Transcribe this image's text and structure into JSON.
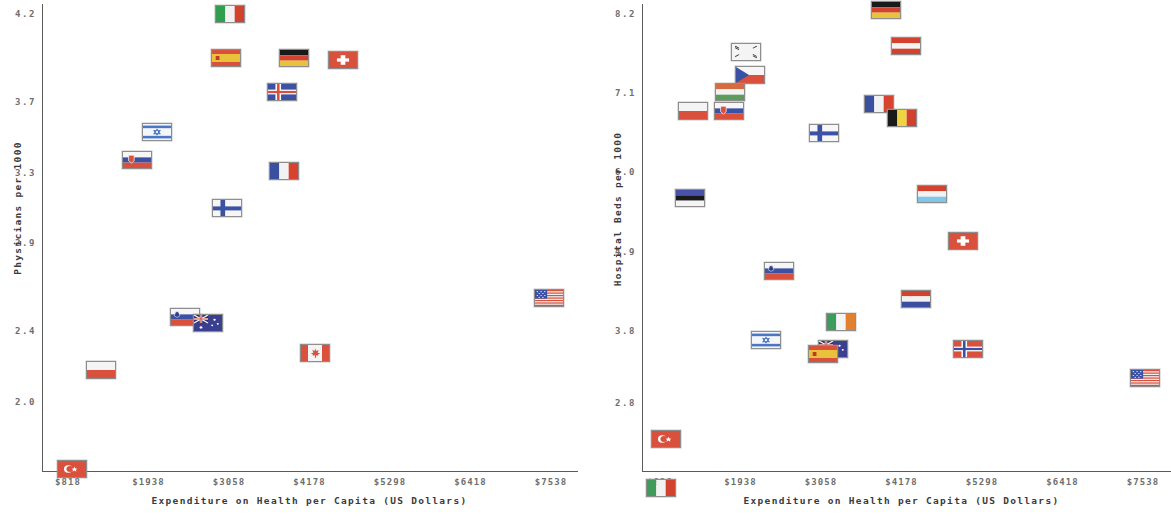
{
  "chart_data": [
    {
      "type": "scatter",
      "panel": "left",
      "title": "",
      "xlabel": "Expenditure on Health per Capita (US Dollars)",
      "ylabel": "Physicians per 1000",
      "xticks": [
        "$818",
        "$1938",
        "$3058",
        "$4178",
        "$5298",
        "$6418",
        "$7538"
      ],
      "xtickvalues": [
        818,
        1938,
        3058,
        4178,
        5298,
        6418,
        7538
      ],
      "yticks": [
        "4.2",
        "3.7",
        "3.3",
        "2.9",
        "2.4",
        "2.0"
      ],
      "ytickvalues": [
        4.2,
        3.7,
        3.3,
        2.9,
        2.4,
        2.0
      ],
      "xlim": [
        640,
        7900
      ],
      "ylim": [
        1.55,
        4.32
      ],
      "grid": false,
      "legend": "none",
      "marker": "country-flag",
      "points": [
        {
          "country": "Italy",
          "flag": "it",
          "x": 3072,
          "y": 4.2
        },
        {
          "country": "Spain",
          "flag": "es",
          "x": 3010,
          "y": 3.95
        },
        {
          "country": "Germany",
          "flag": "de",
          "x": 3960,
          "y": 3.95
        },
        {
          "country": "Switzerland",
          "flag": "ch",
          "x": 4640,
          "y": 3.94
        },
        {
          "country": "Iceland",
          "flag": "is",
          "x": 3800,
          "y": 3.76
        },
        {
          "country": "Israel",
          "flag": "il",
          "x": 2060,
          "y": 3.53
        },
        {
          "country": "Slovakia",
          "flag": "sk",
          "x": 1780,
          "y": 3.37
        },
        {
          "country": "France",
          "flag": "fr",
          "x": 3830,
          "y": 3.31
        },
        {
          "country": "Finland",
          "flag": "fi",
          "x": 3030,
          "y": 3.1
        },
        {
          "country": "United States",
          "flag": "us",
          "x": 7510,
          "y": 2.59
        },
        {
          "country": "Slovenia",
          "flag": "si",
          "x": 2450,
          "y": 2.48
        },
        {
          "country": "Australia",
          "flag": "au",
          "x": 2760,
          "y": 2.45
        },
        {
          "country": "Canada",
          "flag": "ca",
          "x": 4250,
          "y": 2.28
        },
        {
          "country": "Poland",
          "flag": "pl",
          "x": 1280,
          "y": 2.18
        },
        {
          "country": "Turkey",
          "flag": "tr",
          "x": 880,
          "y": 1.62
        }
      ]
    },
    {
      "type": "scatter",
      "panel": "right",
      "title": "",
      "xlabel": "Expenditure on Health per Capita (US Dollars)",
      "ylabel": "Hospital Beds per 1000",
      "xticks": [
        "$818",
        "$1938",
        "$3058",
        "$4178",
        "$5298",
        "$6418",
        "$7538"
      ],
      "xtickvalues": [
        818,
        1938,
        3058,
        4178,
        5298,
        6418,
        7538
      ],
      "yticks": [
        "8.2",
        "7.1",
        "6.0",
        "4.9",
        "3.8",
        "2.8"
      ],
      "ytickvalues": [
        8.2,
        7.1,
        6.0,
        4.9,
        3.8,
        2.8
      ],
      "xlim": [
        640,
        7900
      ],
      "ylim": [
        1.05,
        8.45
      ],
      "grid": false,
      "legend": "none",
      "marker": "country-flag",
      "points": [
        {
          "country": "Germany",
          "flag": "de",
          "x": 3960,
          "y": 8.25
        },
        {
          "country": "Austria",
          "flag": "at",
          "x": 4240,
          "y": 7.75
        },
        {
          "country": "South Korea",
          "flag": "kr",
          "x": 2010,
          "y": 7.67
        },
        {
          "country": "Czech Republic",
          "flag": "cz",
          "x": 2070,
          "y": 7.35
        },
        {
          "country": "Hungary",
          "flag": "hu",
          "x": 1790,
          "y": 7.12
        },
        {
          "country": "Poland",
          "flag": "pl",
          "x": 1280,
          "y": 6.85
        },
        {
          "country": "Slovakia",
          "flag": "sk",
          "x": 1780,
          "y": 6.85
        },
        {
          "country": "France",
          "flag": "fr",
          "x": 3870,
          "y": 6.95
        },
        {
          "country": "Belgium",
          "flag": "be",
          "x": 4180,
          "y": 6.75
        },
        {
          "country": "Finland",
          "flag": "fi",
          "x": 3100,
          "y": 6.55
        },
        {
          "country": "Estonia",
          "flag": "ee",
          "x": 1240,
          "y": 5.65
        },
        {
          "country": "Luxembourg",
          "flag": "lu",
          "x": 4600,
          "y": 5.7
        },
        {
          "country": "Switzerland",
          "flag": "ch",
          "x": 5040,
          "y": 5.05
        },
        {
          "country": "Slovenia",
          "flag": "si",
          "x": 2470,
          "y": 4.63
        },
        {
          "country": "Netherlands",
          "flag": "nl",
          "x": 4380,
          "y": 4.25
        },
        {
          "country": "Ireland",
          "flag": "ie",
          "x": 3340,
          "y": 3.92
        },
        {
          "country": "Israel",
          "flag": "il",
          "x": 2290,
          "y": 3.68
        },
        {
          "country": "Australia",
          "flag": "au",
          "x": 3230,
          "y": 3.55
        },
        {
          "country": "Spain",
          "flag": "es",
          "x": 3080,
          "y": 3.48
        },
        {
          "country": "Norway",
          "flag": "no",
          "x": 5110,
          "y": 3.55
        },
        {
          "country": "United States",
          "flag": "us",
          "x": 7560,
          "y": 3.15
        },
        {
          "country": "Turkey",
          "flag": "tr",
          "x": 905,
          "y": 2.3
        },
        {
          "country": "Mexico",
          "flag": "mx",
          "x": 830,
          "y": 1.62
        }
      ]
    }
  ],
  "axis_color": "#5a5a5a",
  "tick_text_color": "#6e6e6e",
  "label_text_color": "#3a3a3a"
}
